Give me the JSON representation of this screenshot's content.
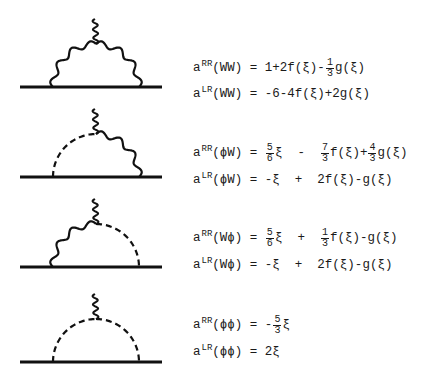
{
  "diagrams": [
    {
      "name": "WW",
      "left": "wavy",
      "right": "wavy"
    },
    {
      "name": "phiW",
      "left": "dashed",
      "right": "wavy"
    },
    {
      "name": "Wphi",
      "left": "wavy",
      "right": "dashed"
    },
    {
      "name": "phiphi",
      "left": "dashed",
      "right": "dashed"
    }
  ],
  "equations": [
    {
      "base": "a",
      "sup": "RR",
      "arg": "(WW)",
      "eq": " = ",
      "rhs": [
        {
          "t": "1+2f(ξ)-"
        },
        {
          "num": "1",
          "den": "3"
        },
        {
          "t": "g(ξ)"
        }
      ]
    },
    {
      "base": "a",
      "sup": "LR",
      "arg": "(WW)",
      "eq": " = ",
      "rhs": [
        {
          "t": "-6-4f(ξ)+2g(ξ)"
        }
      ]
    },
    {
      "base": "a",
      "sup": "RR",
      "arg": "(ϕW)",
      "eq": " = ",
      "rhs": [
        {
          "num": "5",
          "den": "6"
        },
        {
          "t": "ξ  -  "
        },
        {
          "num": "7",
          "den": "3"
        },
        {
          "t": "f(ξ)+"
        },
        {
          "num": "4",
          "den": "3"
        },
        {
          "t": "g(ξ)"
        }
      ]
    },
    {
      "base": "a",
      "sup": "LR",
      "arg": "(ϕW)",
      "eq": " = ",
      "rhs": [
        {
          "t": "-ξ  +  2f(ξ)-g(ξ)"
        }
      ]
    },
    {
      "base": "a",
      "sup": "RR",
      "arg": "(Wϕ)",
      "eq": " = ",
      "rhs": [
        {
          "num": "5",
          "den": "6"
        },
        {
          "t": "ξ  +  "
        },
        {
          "num": "1",
          "den": "3"
        },
        {
          "t": "f(ξ)-g(ξ)"
        }
      ]
    },
    {
      "base": "a",
      "sup": "LR",
      "arg": "(Wϕ)",
      "eq": " = ",
      "rhs": [
        {
          "t": "-ξ  +  2f(ξ)-g(ξ)"
        }
      ]
    },
    {
      "base": "a",
      "sup": "RR",
      "arg": "(ϕϕ)",
      "eq": " = ",
      "rhs": [
        {
          "t": "-"
        },
        {
          "num": "5",
          "den": "3"
        },
        {
          "t": "ξ"
        }
      ]
    },
    {
      "base": "a",
      "sup": "LR",
      "arg": "(ϕϕ)",
      "eq": " = ",
      "rhs": [
        {
          "t": "2ξ"
        }
      ]
    }
  ],
  "layout": {
    "diagram_tops": [
      5,
      95,
      185,
      280
    ],
    "equation_tops": [
      58,
      84,
      143,
      170,
      228,
      255,
      315,
      342
    ]
  }
}
